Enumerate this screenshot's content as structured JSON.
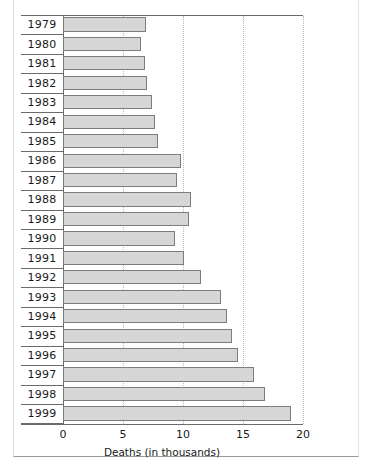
{
  "chart_data": {
    "type": "bar",
    "orientation": "horizontal",
    "title": "",
    "xlabel": "Deaths (in thousands)",
    "ylabel": "",
    "categories": [
      "1979",
      "1980",
      "1981",
      "1982",
      "1983",
      "1984",
      "1985",
      "1986",
      "1987",
      "1988",
      "1989",
      "1990",
      "1991",
      "1992",
      "1993",
      "1994",
      "1995",
      "1996",
      "1997",
      "1998",
      "1999"
    ],
    "values": [
      6.9,
      6.5,
      6.8,
      7.0,
      7.4,
      7.7,
      7.9,
      9.8,
      9.5,
      10.7,
      10.5,
      9.3,
      10.1,
      11.5,
      13.2,
      13.7,
      14.1,
      14.6,
      15.9,
      16.8,
      19.0
    ],
    "xlim": [
      0,
      20
    ],
    "xticks": [
      0,
      5,
      10,
      15,
      20
    ],
    "xtick_labels": [
      "0",
      "5",
      "10",
      "15",
      "20"
    ],
    "grid": "vertical-dotted",
    "legend": "none",
    "bar_fill": "#d6d6d6",
    "bar_border": "#7d7d7d"
  }
}
